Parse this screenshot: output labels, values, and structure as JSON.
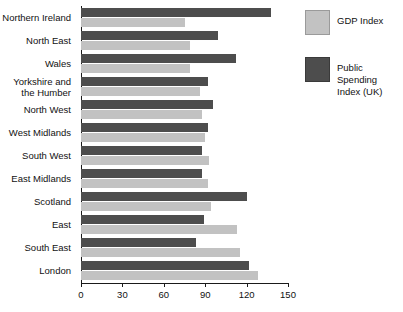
{
  "chart_data": {
    "type": "bar",
    "orientation": "horizontal",
    "title": "",
    "xlabel": "",
    "ylabel": "",
    "xlim": [
      0,
      150
    ],
    "xticks": [
      0,
      30,
      60,
      90,
      120,
      150
    ],
    "grid": false,
    "legend_position": "right",
    "categories": [
      "Northern Ireland",
      "North East",
      "Wales",
      "Yorkshire and the Humber",
      "North West",
      "West Midlands",
      "South West",
      "East Midlands",
      "Scotland",
      "East",
      "South East",
      "London"
    ],
    "series": [
      {
        "name": "GDP Index",
        "color": "#c2c2c2",
        "values": [
          75,
          79,
          79,
          86,
          88,
          90,
          93,
          92,
          94,
          113,
          115,
          128
        ]
      },
      {
        "name": "Public Spending Index (UK)",
        "color": "#4d4d4d",
        "values": [
          138,
          99,
          112,
          92,
          96,
          92,
          88,
          88,
          120,
          89,
          83,
          122
        ]
      }
    ]
  },
  "legend": {
    "items": [
      {
        "label": "GDP Index",
        "swatch": "light"
      },
      {
        "label": "Public Spending Index (UK)",
        "swatch": "dark"
      }
    ]
  },
  "axis": {
    "tick_labels": [
      "0",
      "30",
      "60",
      "90",
      "120",
      "150"
    ]
  },
  "colors": {
    "gdp": "#c2c2c2",
    "public_spending": "#4d4d4d",
    "axis": "#1a1a1a",
    "background": "#ffffff"
  }
}
